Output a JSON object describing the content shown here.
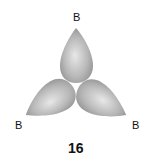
{
  "diagram": {
    "labels": {
      "top": "B",
      "left": "B",
      "right": "B"
    },
    "caption": "16",
    "lobe_count": 3,
    "colors": {
      "lobe_light": "#e6e6e6",
      "lobe_mid": "#b3b3b3",
      "lobe_dark": "#8c8c8c"
    }
  }
}
